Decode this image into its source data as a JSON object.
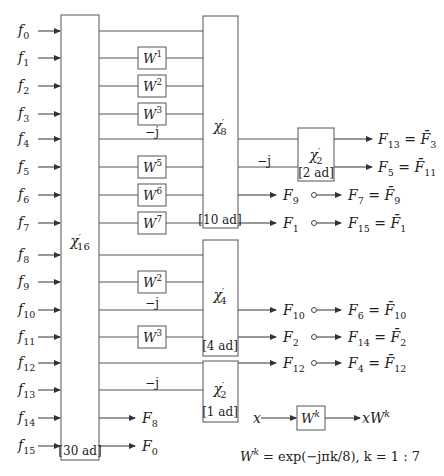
{
  "diagram": {
    "inputs": [
      "f0",
      "f1",
      "f2",
      "f3",
      "f4",
      "f5",
      "f6",
      "f7",
      "f8",
      "f9",
      "f10",
      "f11",
      "f12",
      "f13",
      "f14",
      "f15"
    ],
    "input_labels": [
      {
        "base": "f",
        "sub": "0"
      },
      {
        "base": "f",
        "sub": "1"
      },
      {
        "base": "f",
        "sub": "2"
      },
      {
        "base": "f",
        "sub": "3"
      },
      {
        "base": "f",
        "sub": "4"
      },
      {
        "base": "f",
        "sub": "5"
      },
      {
        "base": "f",
        "sub": "6"
      },
      {
        "base": "f",
        "sub": "7"
      },
      {
        "base": "f",
        "sub": "8"
      },
      {
        "base": "f",
        "sub": "9"
      },
      {
        "base": "f",
        "sub": "10"
      },
      {
        "base": "f",
        "sub": "11"
      },
      {
        "base": "f",
        "sub": "12"
      },
      {
        "base": "f",
        "sub": "13"
      },
      {
        "base": "f",
        "sub": "14"
      },
      {
        "base": "f",
        "sub": "15"
      }
    ],
    "blocks": {
      "chi16": {
        "symbol": "χ",
        "prime": "′",
        "sub": "16",
        "cost": "[30 ad]"
      },
      "chi8": {
        "symbol": "χ",
        "prime": "′",
        "sub": "8",
        "cost": "[10 ad]"
      },
      "chi4": {
        "symbol": "χ",
        "prime": "′",
        "sub": "4",
        "cost": "[4 ad]"
      },
      "chi2a": {
        "symbol": "χ",
        "prime": "′",
        "sub": "2",
        "cost": "[1 ad]"
      },
      "chi2b": {
        "symbol": "χ",
        "prime": "′",
        "sub": "2",
        "cost": "[2 ad]"
      }
    },
    "twiddles": [
      {
        "row": 1,
        "base": "W",
        "exp": "1"
      },
      {
        "row": 2,
        "base": "W",
        "exp": "2"
      },
      {
        "row": 3,
        "base": "W",
        "exp": "3"
      },
      {
        "row": 5,
        "base": "W",
        "exp": "5"
      },
      {
        "row": 6,
        "base": "W",
        "exp": "6"
      },
      {
        "row": 7,
        "base": "W",
        "exp": "7"
      },
      {
        "row": 9,
        "base": "W",
        "exp": "2"
      },
      {
        "row": 11,
        "base": "W",
        "exp": "3"
      }
    ],
    "minus_j": "−j",
    "outputs": {
      "F13": {
        "lhs": "F",
        "lhs_sub": "13",
        "rhs": "F̄",
        "rhs_sub": "3"
      },
      "F5": {
        "lhs": "F",
        "lhs_sub": "5",
        "rhs": "F̄",
        "rhs_sub": "11"
      },
      "F9": {
        "base": "F",
        "sub": "9"
      },
      "F7": {
        "lhs": "F",
        "lhs_sub": "7",
        "rhs": "F̄",
        "rhs_sub": "9"
      },
      "F1": {
        "base": "F",
        "sub": "1"
      },
      "F15": {
        "lhs": "F",
        "lhs_sub": "15",
        "rhs": "F̄",
        "rhs_sub": "1"
      },
      "F10": {
        "base": "F",
        "sub": "10"
      },
      "F6": {
        "lhs": "F",
        "lhs_sub": "6",
        "rhs": "F̄",
        "rhs_sub": "10"
      },
      "F2": {
        "base": "F",
        "sub": "2"
      },
      "F14": {
        "lhs": "F",
        "lhs_sub": "14",
        "rhs": "F̄",
        "rhs_sub": "2"
      },
      "F12": {
        "base": "F",
        "sub": "12"
      },
      "F4": {
        "lhs": "F",
        "lhs_sub": "4",
        "rhs": "F̄",
        "rhs_sub": "12"
      },
      "F8": {
        "base": "F",
        "sub": "8"
      },
      "F0": {
        "base": "F",
        "sub": "0"
      }
    },
    "legend": {
      "input": "x",
      "block_base": "W",
      "block_exp": "k",
      "output_base": "xW",
      "output_exp": "k",
      "formula_lhs_base": "W",
      "formula_lhs_exp": "k",
      "formula_rhs": " = exp(−jπk/8), k = 1 : 7"
    }
  },
  "colors": {
    "line": "#555555",
    "text": "#222222",
    "background": "#ffffff"
  }
}
